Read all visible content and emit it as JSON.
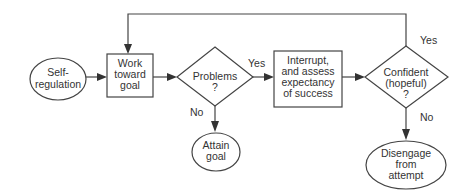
{
  "diagram": {
    "nodes": {
      "self_regulation": {
        "type": "ellipse",
        "lines": [
          "Self-",
          "regulation"
        ]
      },
      "work_toward_goal": {
        "type": "box",
        "lines": [
          "Work",
          "toward",
          "goal"
        ]
      },
      "problems": {
        "type": "diamond",
        "lines": [
          "Problems",
          "?"
        ]
      },
      "attain_goal": {
        "type": "ellipse",
        "lines": [
          "Attain",
          "goal"
        ]
      },
      "interrupt": {
        "type": "box",
        "lines": [
          "Interrupt,",
          "and assess",
          "expectancy",
          "of success"
        ]
      },
      "confident": {
        "type": "diamond",
        "lines": [
          "Confident",
          "(hopeful)",
          "?"
        ]
      },
      "disengage": {
        "type": "ellipse",
        "lines": [
          "Disengage",
          "from",
          "attempt"
        ]
      }
    },
    "edges": {
      "problems_yes": "Yes",
      "problems_no": "No",
      "confident_yes": "Yes",
      "confident_no": "No"
    },
    "colors": {
      "stroke": "#444444",
      "text": "#333333",
      "background": "#ffffff"
    }
  }
}
